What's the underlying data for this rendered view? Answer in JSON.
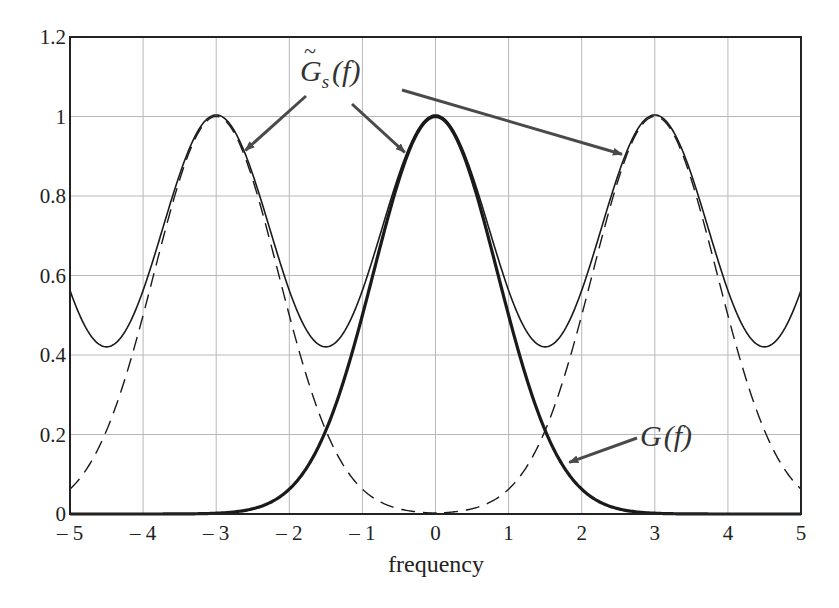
{
  "chart_data": {
    "type": "line",
    "title": "",
    "xlabel": "frequency",
    "ylabel": "",
    "xlim": [
      -5,
      5
    ],
    "ylim": [
      0,
      1.2
    ],
    "grid": true,
    "legend": null,
    "x_ticks": [
      "-5",
      "-4",
      "-3",
      "-2",
      "-1",
      "0",
      "1",
      "2",
      "3",
      "4",
      "5"
    ],
    "y_ticks": [
      "0",
      "0.2",
      "0.4",
      "0.6",
      "0.8",
      "1",
      "1.2"
    ],
    "model": {
      "description": "G(f) = 2^(-f^2) Gaussian; G~s(f) = sum_k G(f - 3k) periodic replica with period 3",
      "period": 3,
      "gaussian_decay": 0.6931
    },
    "x": [
      -5,
      -4.5,
      -4,
      -3.5,
      -3,
      -2.5,
      -2,
      -1.5,
      -1,
      -0.5,
      0,
      0.5,
      1,
      1.5,
      2,
      2.5,
      3,
      3.5,
      4,
      4.5,
      5
    ],
    "series": [
      {
        "name": "G(f)",
        "style": "bold-solid",
        "values": [
          0.0,
          0.0,
          0.0,
          0.0002,
          0.002,
          0.013,
          0.063,
          0.21,
          0.5,
          0.841,
          1.0,
          0.841,
          0.5,
          0.21,
          0.063,
          0.013,
          0.002,
          0.0002,
          0.0,
          0.0,
          0.0
        ]
      },
      {
        "name": "G~s(f)",
        "style": "thin-solid",
        "values": [
          0.563,
          0.42,
          0.563,
          0.854,
          1.004,
          0.854,
          0.563,
          0.42,
          0.563,
          0.854,
          1.004,
          0.854,
          0.563,
          0.42,
          0.563,
          0.854,
          1.004,
          0.854,
          0.563,
          0.42,
          0.563
        ]
      },
      {
        "name": "G(f+3)",
        "style": "dashed",
        "values": [
          0.063,
          0.21,
          0.5,
          0.841,
          1.0,
          0.841,
          0.5,
          0.21,
          0.063,
          0.013,
          0.002,
          0.0002,
          0.0,
          0.0,
          0.0,
          0.0,
          0.0,
          0.0,
          0.0,
          0.0,
          0.0
        ]
      },
      {
        "name": "G(f-3)",
        "style": "dashed",
        "values": [
          0.0,
          0.0,
          0.0,
          0.0,
          0.0,
          0.0,
          0.0,
          0.0,
          0.0,
          0.0002,
          0.002,
          0.013,
          0.063,
          0.21,
          0.5,
          0.841,
          1.0,
          0.841,
          0.5,
          0.21,
          0.063
        ]
      }
    ],
    "annotations": [
      {
        "text": "G~s(f)",
        "main": "G",
        "sub": "s",
        "arg": "(f)",
        "arrows_to": [
          [
            -2.6,
            0.92
          ],
          [
            -0.4,
            0.92
          ],
          [
            2.6,
            0.92
          ]
        ]
      },
      {
        "text": "G(f)",
        "main": "G",
        "arg": "(f)",
        "arrows_to": [
          [
            1.85,
            0.13
          ]
        ]
      }
    ]
  },
  "labels": {
    "xlabel": "frequency",
    "annot_gs_main": "G",
    "annot_gs_tilde": "~",
    "annot_gs_sub": "s",
    "annot_gs_arg": "(f)",
    "annot_g_main": "G",
    "annot_g_arg": "(f)"
  },
  "colors": {
    "axis": "#222222",
    "grid": "#b8b8b8",
    "curve": "#1a1a1a",
    "arrow": "#4a4a4a"
  }
}
